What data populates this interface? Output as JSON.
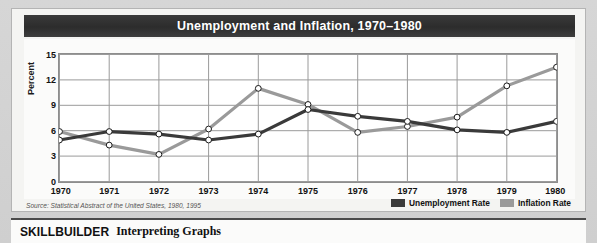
{
  "chart_title": "Unemployment and Inflation, 1970–1980",
  "source_note": "Source: Statistical Abstract of the United States, 1980, 1995",
  "legend": {
    "items": [
      {
        "label": "Unemployment Rate",
        "color": "#3a3a3a"
      },
      {
        "label": "Inflation Rate",
        "color": "#9a9a9a"
      }
    ]
  },
  "skillbuilder": {
    "kicker": "SKILLBUILDER",
    "subtitle": "Interpreting Graphs"
  },
  "colors": {
    "title_bar": "#2f2f2f",
    "title_text": "#ffffff",
    "unemployment": "#3a3a3a",
    "inflation": "#9a9a9a",
    "grid": "#9a9a9a",
    "plot_background": "#ffffff",
    "card_background": "#f4f4f2",
    "page_background": "#d2d2d2",
    "marker_fill": "#ffffff",
    "marker_stroke": "#1a1a1a"
  },
  "chart_data": {
    "type": "line",
    "title": "Unemployment and Inflation, 1970–1980",
    "xlabel": "",
    "ylabel": "Percent",
    "x": [
      1970,
      1971,
      1972,
      1973,
      1974,
      1975,
      1976,
      1977,
      1978,
      1979,
      1980
    ],
    "categories": [
      "1970",
      "1971",
      "1972",
      "1973",
      "1974",
      "1975",
      "1976",
      "1977",
      "1978",
      "1979",
      "1980"
    ],
    "xtick_labels": [
      "1970",
      "1971",
      "1972",
      "1973",
      "1974",
      "1975",
      "1976",
      "1977",
      "1978",
      "1979",
      "1980"
    ],
    "ytick_labels": [
      "0",
      "3",
      "6",
      "9",
      "12",
      "15"
    ],
    "yticks": [
      0,
      3,
      6,
      9,
      12,
      15
    ],
    "ylim": [
      0,
      15
    ],
    "xlim": [
      1970,
      1980
    ],
    "grid": true,
    "legend_position": "bottom-right",
    "markers": "open-circle",
    "series": [
      {
        "name": "Unemployment Rate",
        "color": "#3a3a3a",
        "values": [
          4.9,
          5.9,
          5.6,
          4.9,
          5.6,
          8.5,
          7.7,
          7.1,
          6.1,
          5.8,
          7.1
        ]
      },
      {
        "name": "Inflation Rate",
        "color": "#9a9a9a",
        "values": [
          5.9,
          4.3,
          3.2,
          6.2,
          11.0,
          9.1,
          5.8,
          6.5,
          7.6,
          11.3,
          13.5
        ]
      }
    ],
    "source": "Source: Statistical Abstract of the United States, 1980, 1995"
  }
}
